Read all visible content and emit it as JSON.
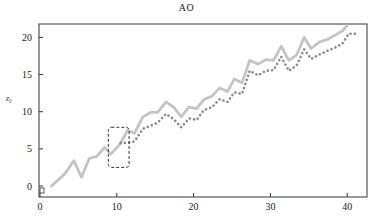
{
  "chart_data": {
    "type": "line",
    "title": "AO",
    "xlabel": "",
    "ylabel": "z₀",
    "xlim": [
      0,
      42.5
    ],
    "ylim": [
      -0.8,
      21.5
    ],
    "xticks": [
      0,
      10,
      20,
      30,
      40
    ],
    "yticks": [
      0,
      5,
      10,
      15,
      20
    ],
    "grid": false,
    "legend": null,
    "series": [
      {
        "name": "solid",
        "style": "solid",
        "color": "#c4c4c4",
        "x": [
          1.5,
          3.2,
          4.4,
          5.4,
          6.4,
          7.4,
          8.4,
          9.2,
          10.4,
          11.4,
          12.3,
          13.4,
          14.4,
          15.3,
          16.4,
          17.4,
          18.4,
          19.4,
          20.4,
          21.3,
          22.4,
          23.4,
          24.4,
          25.3,
          26.3,
          27.3,
          28.4,
          29.4,
          30.4,
          31.4,
          32.4,
          33.4,
          34.4,
          35.3,
          36.4,
          37.4,
          38.4,
          39.4,
          40.0
        ],
        "y": [
          0.0,
          1.6,
          3.4,
          1.2,
          3.7,
          4.0,
          5.2,
          4.3,
          5.6,
          7.5,
          7.1,
          9.3,
          9.9,
          9.9,
          11.3,
          10.6,
          9.3,
          10.6,
          10.4,
          11.6,
          12.1,
          13.2,
          12.7,
          14.4,
          13.9,
          16.9,
          16.4,
          17.0,
          16.9,
          18.8,
          16.9,
          17.6,
          20.0,
          18.5,
          19.4,
          19.7,
          20.3,
          20.9,
          21.6
        ]
      },
      {
        "name": "dotted",
        "style": "dotted",
        "color": "#8a8a8a",
        "x": [
          10.5,
          11.4,
          12.3,
          13.4,
          14.4,
          15.3,
          16.4,
          17.4,
          18.4,
          19.4,
          20.4,
          21.3,
          22.4,
          23.4,
          24.4,
          25.3,
          26.3,
          27.3,
          28.4,
          29.4,
          30.4,
          31.4,
          32.4,
          33.4,
          34.4,
          35.3,
          36.4,
          37.4,
          38.4,
          39.4,
          40.2,
          41.2
        ],
        "y": [
          5.8,
          5.8,
          6.0,
          7.7,
          8.1,
          8.5,
          9.7,
          9.0,
          7.9,
          9.1,
          8.9,
          10.2,
          10.6,
          11.7,
          11.3,
          12.6,
          12.4,
          15.5,
          14.9,
          15.5,
          15.6,
          17.4,
          15.5,
          16.2,
          18.4,
          17.1,
          17.7,
          18.2,
          18.6,
          19.2,
          20.5,
          20.5
        ]
      }
    ],
    "annotations": [
      {
        "type": "dashed-rounded-rect",
        "x0": 8.9,
        "x1": 11.6,
        "y0": 2.5,
        "y1": 7.9
      }
    ]
  }
}
